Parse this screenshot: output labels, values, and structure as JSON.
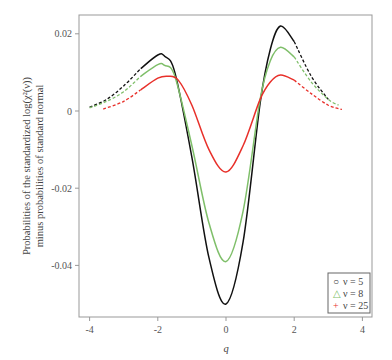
{
  "chart_data": {
    "type": "line",
    "title": "",
    "xlabel": "q",
    "ylabel_line1": "Probabilities of the standardized log(χ²(ν))",
    "ylabel_line2": "minus probabilities of standard normal",
    "xlim": [
      -4.3,
      4.3
    ],
    "ylim": [
      -0.0535,
      0.025
    ],
    "xticks": [
      -4,
      -2,
      0,
      2,
      4
    ],
    "xtick_labels": [
      "-4",
      "-2",
      "0",
      "2",
      "4"
    ],
    "yticks": [
      0.02,
      0,
      -0.02,
      -0.04
    ],
    "ytick_labels": [
      "0.02",
      "0",
      "-0.02",
      "-0.04"
    ],
    "grid": false,
    "legend_position": "lower right",
    "series": [
      {
        "name": "ν = 5",
        "marker": "circle",
        "color": "#111111",
        "x": [
          -4.0,
          -3.5,
          -3.0,
          -2.5,
          -2.0,
          -1.8,
          -1.5,
          -1.0,
          -0.5,
          0.0,
          0.5,
          1.0,
          1.3,
          1.6,
          2.0,
          2.5,
          3.0
        ],
        "y": [
          0.001,
          0.003,
          0.0065,
          0.011,
          0.0145,
          0.0142,
          0.01,
          -0.012,
          -0.038,
          -0.05,
          -0.034,
          0.002,
          0.016,
          0.022,
          0.018,
          0.009,
          0.003
        ]
      },
      {
        "name": "ν = 8",
        "marker": "triangle",
        "color": "#7fbf6a",
        "x": [
          -4.0,
          -3.5,
          -3.0,
          -2.5,
          -2.0,
          -1.8,
          -1.5,
          -1.0,
          -0.5,
          0.0,
          0.5,
          1.0,
          1.3,
          1.6,
          2.0,
          2.5,
          3.0,
          3.3
        ],
        "y": [
          0.0008,
          0.0025,
          0.005,
          0.009,
          0.012,
          0.0118,
          0.009,
          -0.009,
          -0.029,
          -0.039,
          -0.026,
          0.003,
          0.013,
          0.0165,
          0.014,
          0.0075,
          0.003,
          0.0015
        ]
      },
      {
        "name": "ν = 25",
        "marker": "plus",
        "color": "#e8302a",
        "x": [
          -3.6,
          -3.0,
          -2.5,
          -2.0,
          -1.7,
          -1.4,
          -1.0,
          -0.5,
          0.0,
          0.5,
          1.0,
          1.3,
          1.6,
          2.0,
          2.5,
          3.0,
          3.4
        ],
        "y": [
          0.0005,
          0.0025,
          0.0055,
          0.0085,
          0.009,
          0.008,
          0.0015,
          -0.01,
          -0.0158,
          -0.009,
          0.003,
          0.0075,
          0.0093,
          0.008,
          0.0045,
          0.0015,
          0.0004
        ]
      }
    ]
  },
  "legend": {
    "items": [
      {
        "symbol": "○",
        "label": "ν = 5",
        "color": "#333333"
      },
      {
        "symbol": "△",
        "label": "ν = 8",
        "color": "#7fbf6a"
      },
      {
        "symbol": "+",
        "label": "ν = 25",
        "color": "#e8302a"
      }
    ]
  }
}
